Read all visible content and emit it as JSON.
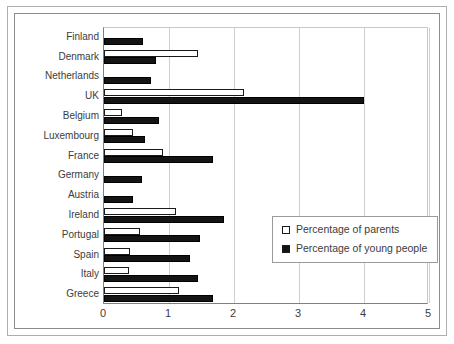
{
  "chart_data": {
    "type": "bar",
    "orientation": "horizontal",
    "title": "",
    "xlabel": "",
    "ylabel": "",
    "xlim": [
      0,
      5
    ],
    "xticks": [
      "0",
      "1",
      "2",
      "3",
      "4",
      "5"
    ],
    "grid": true,
    "legend_position": "center-right",
    "categories": [
      "Finland",
      "Denmark",
      "Netherlands",
      "UK",
      "Belgium",
      "Luxembourg",
      "France",
      "Germany",
      "Austria",
      "Ireland",
      "Portugal",
      "Spain",
      "Italy",
      "Greece"
    ],
    "series": [
      {
        "name": "Percentage of parents",
        "style": "hollow",
        "color": "#ffffff",
        "edge": "#1a1a1a",
        "values": [
          0,
          1.45,
          0,
          2.15,
          0.28,
          0.45,
          0.9,
          0,
          0,
          1.1,
          0.55,
          0.4,
          0.38,
          1.15
        ]
      },
      {
        "name": "Percentage of young people",
        "style": "filled",
        "color": "#141414",
        "edge": "#000000",
        "values": [
          0.6,
          0.8,
          0.73,
          4.0,
          0.85,
          0.63,
          1.68,
          0.58,
          0.45,
          1.85,
          1.48,
          1.33,
          1.45,
          1.68
        ]
      }
    ]
  },
  "legend": {
    "items": [
      {
        "label": "Percentage of parents",
        "style": "hollow"
      },
      {
        "label": "Percentage of young people",
        "style": "filled"
      }
    ]
  }
}
